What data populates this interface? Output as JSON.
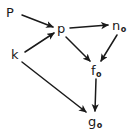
{
  "diagram": {
    "kind": "commutative-diagram",
    "background_color": "#ffffff",
    "ink_color": "#1a1a1a",
    "width": 136,
    "height": 135,
    "nodes": [
      {
        "id": "P",
        "base": "P",
        "sub": "",
        "x": 6,
        "y": 6,
        "label": "P"
      },
      {
        "id": "p",
        "base": "p",
        "sub": "",
        "x": 57,
        "y": 22,
        "label": "p"
      },
      {
        "id": "n0",
        "base": "n",
        "sub": "o",
        "x": 112,
        "y": 19,
        "label": "no"
      },
      {
        "id": "k",
        "base": "k",
        "sub": "",
        "x": 11,
        "y": 48,
        "label": "k"
      },
      {
        "id": "f0",
        "base": "f",
        "sub": "o",
        "x": 91,
        "y": 64,
        "label": "fo"
      },
      {
        "id": "g0",
        "base": "g",
        "sub": "o",
        "x": 88,
        "y": 115,
        "label": "go"
      }
    ],
    "edges": [
      {
        "id": "P-to-p",
        "from": "P",
        "to": "p",
        "x1": 22,
        "y1": 15,
        "x2": 53,
        "y2": 27
      },
      {
        "id": "k-to-p",
        "from": "k",
        "to": "p",
        "x1": 25,
        "y1": 52,
        "x2": 54,
        "y2": 33
      },
      {
        "id": "p-to-n0",
        "from": "p",
        "to": "n0",
        "x1": 70,
        "y1": 28,
        "x2": 108,
        "y2": 25
      },
      {
        "id": "p-to-f0",
        "from": "p",
        "to": "f0",
        "x1": 66,
        "y1": 37,
        "x2": 90,
        "y2": 61
      },
      {
        "id": "n0-to-f0",
        "from": "n0",
        "to": "f0",
        "x1": 117,
        "y1": 35,
        "x2": 101,
        "y2": 61
      },
      {
        "id": "f0-to-g0",
        "from": "f0",
        "to": "g0",
        "x1": 96,
        "y1": 79,
        "x2": 95,
        "y2": 111
      },
      {
        "id": "k-to-g0",
        "from": "k",
        "to": "g0",
        "x1": 22,
        "y1": 62,
        "x2": 86,
        "y2": 112
      }
    ]
  }
}
